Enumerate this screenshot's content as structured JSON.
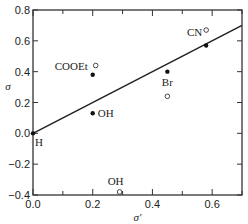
{
  "chart_data": {
    "type": "scatter",
    "title": "",
    "xlabel": "σ′",
    "ylabel": "σ",
    "xlim": [
      0.0,
      0.7
    ],
    "ylim": [
      -0.4,
      0.8
    ],
    "x_ticks": [
      "0.0",
      "0.2",
      "0.4",
      "0.6"
    ],
    "y_ticks": [
      "0.8",
      "0.6",
      "0.4",
      "0.2",
      "0.0",
      "−0.2",
      "−0.4"
    ],
    "grid": false,
    "series": [
      {
        "name": "filled",
        "marker": "filled-circle",
        "points": [
          {
            "label": "H",
            "x": 0.0,
            "y": 0.0
          },
          {
            "label": "COOEt",
            "x": 0.2,
            "y": 0.38
          },
          {
            "label": "OH",
            "x": 0.2,
            "y": 0.13
          },
          {
            "label": "Br",
            "x": 0.45,
            "y": 0.4
          },
          {
            "label": "CN",
            "x": 0.58,
            "y": 0.57
          }
        ]
      },
      {
        "name": "open",
        "marker": "open-circle",
        "points": [
          {
            "label": "COOEt",
            "x": 0.21,
            "y": 0.44
          },
          {
            "label": "OH",
            "x": 0.29,
            "y": -0.38
          },
          {
            "label": "Br",
            "x": 0.45,
            "y": 0.24
          },
          {
            "label": "CN",
            "x": 0.58,
            "y": 0.67
          }
        ]
      }
    ],
    "fit_line": {
      "x": [
        0.0,
        0.7
      ],
      "y": [
        0.0,
        0.7
      ]
    },
    "point_labels": [
      {
        "text": "COOEt",
        "x": 0.2,
        "y": 0.38
      },
      {
        "text": "OH",
        "x": 0.2,
        "y": 0.13
      },
      {
        "text": "Br",
        "x": 0.45,
        "y": 0.4
      },
      {
        "text": "CN",
        "x": 0.58,
        "y": 0.57
      },
      {
        "text": "H",
        "x": 0.0,
        "y": 0.0
      },
      {
        "text": "OH",
        "x": 0.29,
        "y": -0.38
      }
    ]
  }
}
